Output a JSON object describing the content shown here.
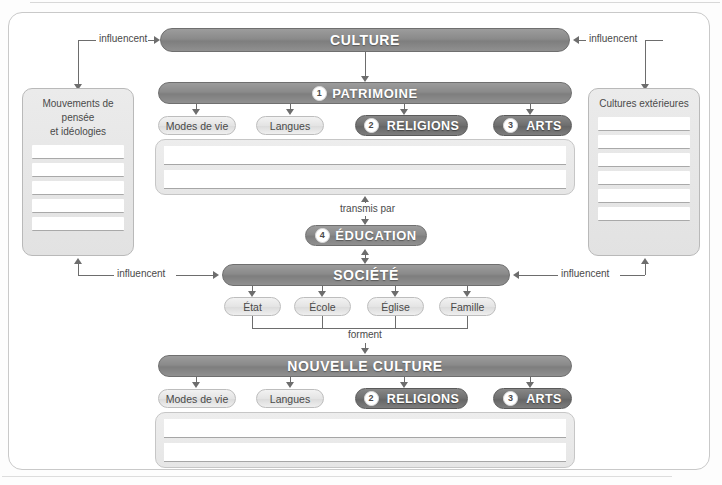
{
  "diagram": {
    "title_bars": {
      "culture": "CULTURE",
      "patrimoine": "PATRIMOINE",
      "societe": "SOCIÉTÉ",
      "nouvelle_culture": "NOUVELLE CULTURE",
      "education": "ÉDUCATION"
    },
    "numbers": {
      "patrimoine": "1",
      "religions": "2",
      "arts": "3",
      "education": "4"
    },
    "patrimoine_items": [
      {
        "label": "Modes de vie",
        "style": "light"
      },
      {
        "label": "Langues",
        "style": "light"
      },
      {
        "label": "RELIGIONS",
        "style": "dark",
        "number": "2"
      },
      {
        "label": "ARTS",
        "style": "dark",
        "number": "3"
      }
    ],
    "nouvelle_culture_items": [
      {
        "label": "Modes de vie",
        "style": "light"
      },
      {
        "label": "Langues",
        "style": "light"
      },
      {
        "label": "RELIGIONS",
        "style": "dark",
        "number": "2"
      },
      {
        "label": "ARTS",
        "style": "dark",
        "number": "3"
      }
    ],
    "societe_items": [
      {
        "label": "État"
      },
      {
        "label": "École"
      },
      {
        "label": "Église"
      },
      {
        "label": "Famille"
      }
    ],
    "left_box": {
      "title_line1": "Mouvements de pensée",
      "title_line2": "et idéologies",
      "blank_lines": 5
    },
    "right_box": {
      "title_line1": "Cultures extérieures",
      "title_line2": "",
      "blank_lines": 6
    },
    "edge_labels": {
      "influencent_top_left": "influencent",
      "influencent_top_right": "influencent",
      "influencent_bottom_left": "influencent",
      "influencent_bottom_right": "influencent",
      "transmis_par": "transmis par",
      "forment": "forment"
    },
    "blank_lines": {
      "patrimoine_box": 2,
      "nouvelle_culture_box": 2
    },
    "colors": {
      "bar_gray": "#8a8a8a",
      "dark_pill": "#6f6f6f",
      "light_pill": "#e4e4e4",
      "box_fill": "#e7e7e7",
      "line": "#6d6d6d",
      "text_dark": "#4a4a4a"
    }
  }
}
